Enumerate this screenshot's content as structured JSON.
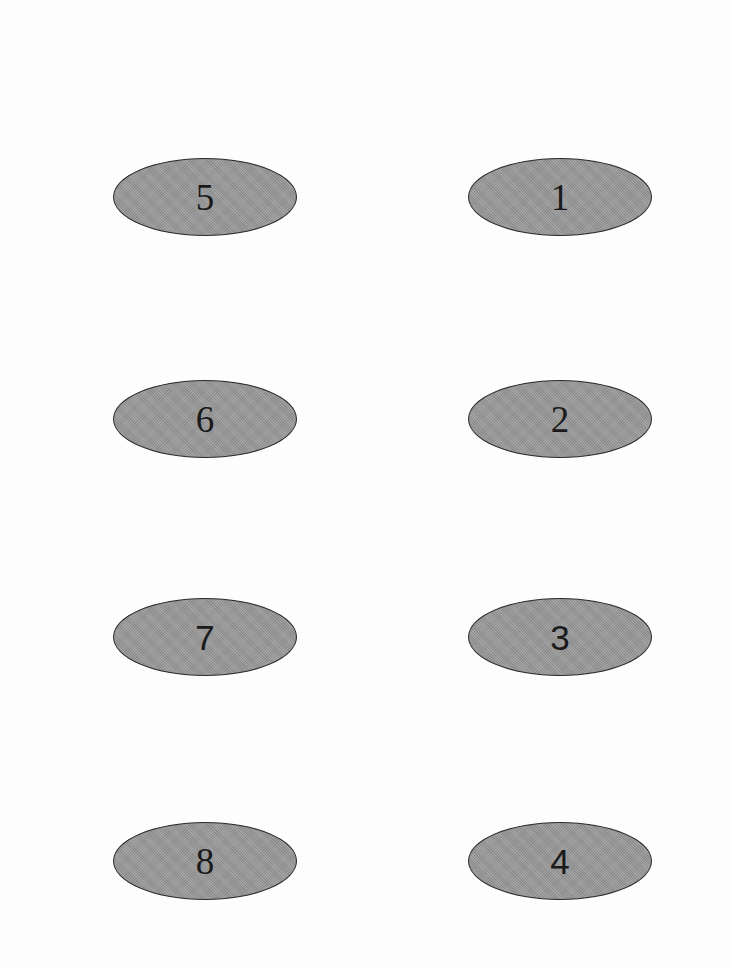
{
  "diagram": {
    "type": "grid of numbered ovals",
    "layout": {
      "columns": 2,
      "rows": 4
    },
    "colors": {
      "oval_fill": "#9b9b9b",
      "oval_outline": "#2a2a2a",
      "label": "#1a1a1a",
      "background": "#fdfdfd"
    },
    "ovals": [
      {
        "label": "5",
        "column": "left",
        "row": 1,
        "font": "serif"
      },
      {
        "label": "1",
        "column": "right",
        "row": 1,
        "font": "serif"
      },
      {
        "label": "6",
        "column": "left",
        "row": 2,
        "font": "serif"
      },
      {
        "label": "2",
        "column": "right",
        "row": 2,
        "font": "serif"
      },
      {
        "label": "7",
        "column": "left",
        "row": 3,
        "font": "sans"
      },
      {
        "label": "3",
        "column": "right",
        "row": 3,
        "font": "sans"
      },
      {
        "label": "8",
        "column": "left",
        "row": 4,
        "font": "serif"
      },
      {
        "label": "4",
        "column": "right",
        "row": 4,
        "font": "sans"
      }
    ]
  }
}
